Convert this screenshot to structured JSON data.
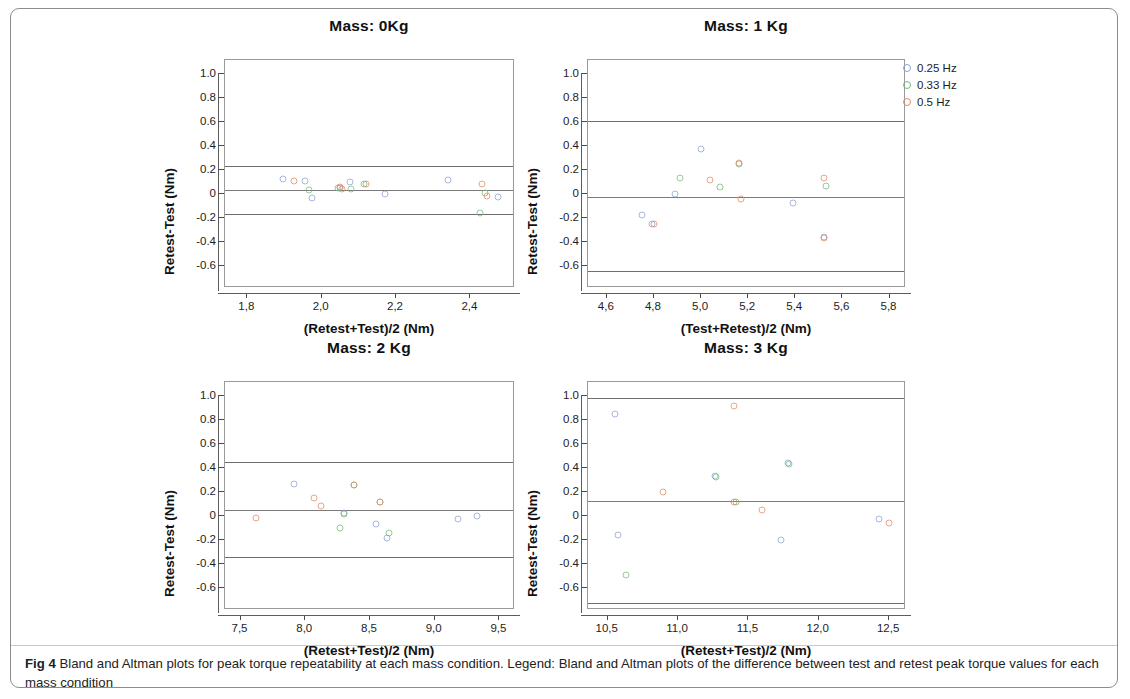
{
  "figure": {
    "caption_label": "Fig 4",
    "caption_text": " Bland and Altman plots for peak torque repeatability at each mass condition. Legend: Bland and Altman plots of the difference between test and retest peak torque values for each mass condition"
  },
  "legend": {
    "position": "top-right",
    "entries": [
      {
        "label": "0.25 Hz",
        "color": "#8e9fd4"
      },
      {
        "label": "0.33 Hz",
        "color": "#74b97a"
      },
      {
        "label": "0.5 Hz",
        "color": "#e08a63"
      }
    ]
  },
  "chart_data": [
    {
      "type": "scatter",
      "title": "Mass: 0Kg",
      "xlabel": "(Retest+Test)/2 (Nm)",
      "ylabel": "Retest-Test (Nm)",
      "xlim": [
        1.74,
        2.52
      ],
      "ylim": [
        -0.78,
        1.12
      ],
      "xticks": [
        1.8,
        2.0,
        2.2,
        2.4
      ],
      "xticklabels": [
        "1,8",
        "2,0",
        "2,2",
        "2,4"
      ],
      "yticks": [
        1.0,
        0.8,
        0.6,
        0.4,
        0.2,
        0,
        -0.2,
        -0.4,
        -0.6
      ],
      "yticklabels": [
        "1.0",
        "0.8",
        "0.6",
        "0.4",
        "0.2",
        "0",
        "-0.2",
        "-0.4",
        "-0.6"
      ],
      "grid": false,
      "reflines": {
        "upper": 0.24,
        "mean": 0.04,
        "lower": -0.16
      },
      "series": [
        {
          "name": "0.25 Hz",
          "color": "#8e9fd4",
          "points": [
            [
              1.895,
              0.125
            ],
            [
              1.955,
              0.115
            ],
            [
              2.075,
              0.105
            ],
            [
              2.17,
              0.005
            ],
            [
              2.34,
              0.12
            ],
            [
              2.475,
              -0.02
            ],
            [
              2.05,
              0.055
            ],
            [
              1.975,
              -0.03
            ]
          ]
        },
        {
          "name": "0.33 Hz",
          "color": "#74b97a",
          "points": [
            [
              1.965,
              0.04
            ],
            [
              2.045,
              0.055
            ],
            [
              2.115,
              0.09
            ],
            [
              2.425,
              -0.155
            ],
            [
              2.08,
              0.045
            ],
            [
              2.44,
              0.015
            ]
          ]
        },
        {
          "name": "0.5 Hz",
          "color": "#e08a63",
          "points": [
            [
              1.925,
              0.11
            ],
            [
              2.05,
              0.06
            ],
            [
              2.12,
              0.09
            ],
            [
              2.43,
              0.085
            ],
            [
              2.445,
              -0.015
            ],
            [
              2.055,
              0.045
            ]
          ]
        }
      ]
    },
    {
      "type": "scatter",
      "title": "Mass: 1 Kg",
      "xlabel": "(Test+Retest)/2 (Nm)",
      "ylabel": "Retest-Test (Nm)",
      "xlim": [
        4.52,
        5.87
      ],
      "ylim": [
        -0.78,
        1.12
      ],
      "xticks": [
        4.6,
        4.8,
        5.0,
        5.2,
        5.4,
        5.6,
        5.8
      ],
      "xticklabels": [
        "4,6",
        "4,8",
        "5,0",
        "5,2",
        "5,4",
        "5,6",
        "5,8"
      ],
      "yticks": [
        1.0,
        0.8,
        0.6,
        0.4,
        0.2,
        0,
        -0.2,
        -0.4,
        -0.6
      ],
      "yticklabels": [
        "1.0",
        "0.8",
        "0.6",
        "0.4",
        "0.2",
        "0",
        "-0.2",
        "-0.4",
        "-0.6"
      ],
      "grid": false,
      "reflines": {
        "upper": 0.61,
        "mean": -0.02,
        "lower": -0.64
      },
      "series": [
        {
          "name": "0.25 Hz",
          "color": "#8e9fd4",
          "points": [
            [
              4.75,
              -0.175
            ],
            [
              4.79,
              -0.25
            ],
            [
              5.0,
              0.375
            ],
            [
              5.39,
              -0.07
            ],
            [
              5.52,
              -0.355
            ],
            [
              4.89,
              0.0
            ]
          ]
        },
        {
          "name": "0.33 Hz",
          "color": "#74b97a",
          "points": [
            [
              4.91,
              0.135
            ],
            [
              5.08,
              0.06
            ],
            [
              5.53,
              0.07
            ],
            [
              5.16,
              0.255
            ]
          ]
        },
        {
          "name": "0.5 Hz",
          "color": "#e08a63",
          "points": [
            [
              5.04,
              0.12
            ],
            [
              5.16,
              0.26
            ],
            [
              5.17,
              -0.035
            ],
            [
              5.52,
              -0.36
            ],
            [
              5.52,
              0.135
            ],
            [
              4.8,
              -0.245
            ]
          ]
        }
      ]
    },
    {
      "type": "scatter",
      "title": "Mass: 2 Kg",
      "xlabel": "(Retest+Test)/2 (Nm)",
      "ylabel": "Retest-Test (Nm)",
      "xlim": [
        7.38,
        9.62
      ],
      "ylim": [
        -0.78,
        1.12
      ],
      "xticks": [
        7.5,
        8.0,
        8.5,
        9.0,
        9.5
      ],
      "xticklabels": [
        "7,5",
        "8,0",
        "8,5",
        "9,0",
        "9,5"
      ],
      "yticks": [
        1.0,
        0.8,
        0.6,
        0.4,
        0.2,
        0,
        -0.2,
        -0.4,
        -0.6
      ],
      "yticklabels": [
        "1.0",
        "0.8",
        "0.6",
        "0.4",
        "0.2",
        "0",
        "-0.2",
        "-0.4",
        "-0.6"
      ],
      "grid": false,
      "reflines": {
        "upper": 0.45,
        "mean": 0.05,
        "lower": -0.34
      },
      "series": [
        {
          "name": "0.25 Hz",
          "color": "#8e9fd4",
          "points": [
            [
              7.91,
              0.27
            ],
            [
              8.3,
              0.03
            ],
            [
              8.55,
              -0.06
            ],
            [
              8.63,
              -0.18
            ],
            [
              9.33,
              0.0
            ],
            [
              9.18,
              -0.02
            ]
          ]
        },
        {
          "name": "0.33 Hz",
          "color": "#74b97a",
          "points": [
            [
              8.3,
              0.02
            ],
            [
              8.58,
              0.12
            ],
            [
              8.27,
              -0.1
            ],
            [
              8.65,
              -0.14
            ],
            [
              8.38,
              0.265
            ]
          ]
        },
        {
          "name": "0.5 Hz",
          "color": "#e08a63",
          "points": [
            [
              7.62,
              -0.015
            ],
            [
              8.07,
              0.155
            ],
            [
              8.12,
              0.09
            ],
            [
              8.38,
              0.265
            ],
            [
              8.58,
              0.12
            ]
          ]
        }
      ]
    },
    {
      "type": "scatter",
      "title": "Mass: 3 Kg",
      "xlabel": "(Retest+Test)/2 (Nm)",
      "ylabel": "Retest-Test (Nm)",
      "xlim": [
        10.36,
        12.62
      ],
      "ylim": [
        -0.78,
        1.12
      ],
      "xticks": [
        10.5,
        11.0,
        11.5,
        12.0,
        12.5
      ],
      "xticklabels": [
        "10,5",
        "11,0",
        "11,5",
        "12,0",
        "12,5"
      ],
      "yticks": [
        1.0,
        0.8,
        0.6,
        0.4,
        0.2,
        0,
        -0.2,
        -0.4,
        -0.6
      ],
      "yticklabels": [
        "1.0",
        "0.8",
        "0.6",
        "0.4",
        "0.2",
        "0",
        "-0.2",
        "-0.4",
        "-0.6"
      ],
      "grid": false,
      "reflines": {
        "upper": 0.99,
        "mean": 0.13,
        "lower": -0.72
      },
      "series": [
        {
          "name": "0.25 Hz",
          "color": "#8e9fd4",
          "points": [
            [
              10.55,
              0.855
            ],
            [
              10.57,
              -0.155
            ],
            [
              11.26,
              0.335
            ],
            [
              11.78,
              0.445
            ],
            [
              11.73,
              -0.2
            ],
            [
              12.43,
              -0.025
            ]
          ]
        },
        {
          "name": "0.33 Hz",
          "color": "#74b97a",
          "points": [
            [
              11.27,
              0.325
            ],
            [
              11.79,
              0.44
            ],
            [
              10.63,
              -0.49
            ],
            [
              11.41,
              0.12
            ]
          ]
        },
        {
          "name": "0.5 Hz",
          "color": "#e08a63",
          "points": [
            [
              11.4,
              0.92
            ],
            [
              10.89,
              0.2
            ],
            [
              11.4,
              0.12
            ],
            [
              11.6,
              0.05
            ],
            [
              12.5,
              -0.055
            ]
          ]
        }
      ]
    }
  ]
}
